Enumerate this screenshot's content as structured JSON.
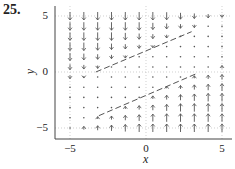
{
  "problem_number": "25.",
  "chart_data": {
    "type": "quiver",
    "title": "",
    "xlabel": "x",
    "ylabel": "y",
    "xlim": [
      -6,
      6
    ],
    "ylim": [
      -6,
      6
    ],
    "xticks": [
      -5,
      0,
      5
    ],
    "yticks": [
      -5,
      0,
      5
    ],
    "xtick_labels": [
      "−5",
      "0",
      "5"
    ],
    "ytick_labels": [
      "5",
      "0",
      "−5"
    ],
    "grid": "dotted at ticks",
    "grid_x": [
      -5,
      -4.09,
      -3.18,
      -2.27,
      -1.36,
      -0.45,
      0.45,
      1.36,
      2.27,
      3.18,
      4.09,
      5
    ],
    "grid_y": [
      -5,
      -4.09,
      -3.18,
      -2.27,
      -1.36,
      -0.45,
      0.45,
      1.36,
      2.27,
      3.18,
      4.09,
      5
    ],
    "field_description": "Arrows point downward in the upper region and upward in the lower region; arrows shrink toward zero between two dashed lines",
    "dashed_lines": [
      {
        "name": "upper",
        "x": [
          -3.3,
          3.0
        ],
        "y": [
          0.0,
          3.6
        ]
      },
      {
        "name": "lower",
        "x": [
          -3.1,
          3.4
        ],
        "y": [
          -3.9,
          -0.1
        ]
      }
    ]
  },
  "axis": {
    "x_label": "x",
    "y_label": "y",
    "x_ticks": [
      "−5",
      "0",
      "5"
    ],
    "y_ticks": [
      "5",
      "0",
      "−5"
    ]
  },
  "colors": {
    "arrow": "#555555",
    "axis": "#444444",
    "grid": "#bbbbbb",
    "dashed": "#555555"
  }
}
